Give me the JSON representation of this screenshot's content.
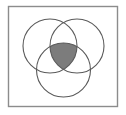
{
  "figure": {
    "type": "venn-diagram",
    "title": "Three-circle Venn diagram with triple intersection shaded",
    "canvas": {
      "width": 126,
      "height": 115,
      "background": "#ffffff"
    },
    "frame": {
      "x": 8.5,
      "y": 6.5,
      "width": 109,
      "height": 100,
      "stroke": "#8c8c8c",
      "stroke_width": 1.4,
      "fill": "none"
    },
    "circles": [
      {
        "id": "set-left",
        "label": "",
        "cx": 50.0,
        "cy": 46.0,
        "r": 27.0
      },
      {
        "id": "set-right",
        "label": "",
        "cx": 77.0,
        "cy": 46.0,
        "r": 27.0
      },
      {
        "id": "set-bottom",
        "label": "",
        "cx": 63.5,
        "cy": 70.0,
        "r": 27.0
      }
    ],
    "circle_style": {
      "stroke": "#5a5a5a",
      "stroke_width": 1.1,
      "fill": "none"
    },
    "shaded_region": {
      "id": "triple-intersection",
      "description": "Intersection of all three circles",
      "fill": "#7c7c7c",
      "stroke": "#3c3c3c",
      "stroke_width": 1.1,
      "vertices": [
        {
          "x": 63.5,
          "y": 19.5
        },
        {
          "x": 86.1,
          "y": 60.9
        },
        {
          "x": 40.9,
          "y": 60.9
        }
      ]
    },
    "labels": []
  }
}
